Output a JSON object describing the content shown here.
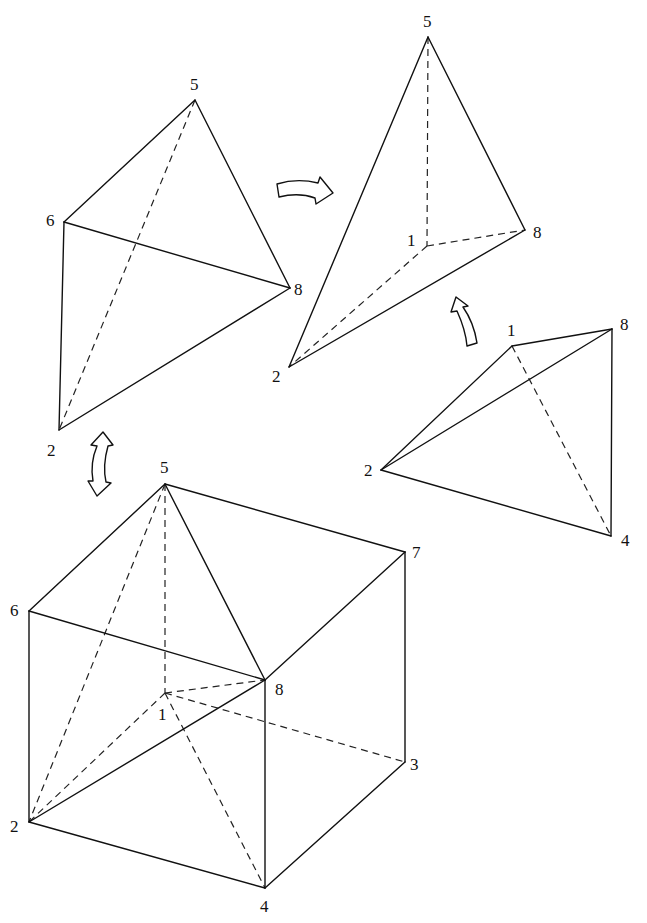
{
  "diagram": {
    "title": "",
    "figures": [
      {
        "id": "tetra-upper-left",
        "vertices": {
          "5": [
            195,
            100
          ],
          "6": [
            64,
            222
          ],
          "8": [
            290,
            288
          ],
          "2": [
            59,
            430
          ]
        },
        "labels": [
          {
            "text": "5",
            "x": 190,
            "y": 90
          },
          {
            "text": "6",
            "x": 46,
            "y": 226
          },
          {
            "text": "8",
            "x": 294,
            "y": 295
          },
          {
            "text": "2",
            "x": 47,
            "y": 456
          }
        ],
        "solid_edges": [
          [
            "5",
            "6"
          ],
          [
            "5",
            "8"
          ],
          [
            "6",
            "8"
          ],
          [
            "6",
            "2"
          ],
          [
            "2",
            "8"
          ]
        ],
        "dashed_edges": [
          [
            "5",
            "2"
          ]
        ]
      },
      {
        "id": "tetra-upper-right",
        "vertices": {
          "5": [
            428,
            37
          ],
          "1": [
            427,
            246
          ],
          "8": [
            525,
            230
          ],
          "2": [
            289,
            367
          ]
        },
        "labels": [
          {
            "text": "5",
            "x": 423,
            "y": 27
          },
          {
            "text": "1",
            "x": 407,
            "y": 246
          },
          {
            "text": "8",
            "x": 533,
            "y": 238
          },
          {
            "text": "2",
            "x": 272,
            "y": 382
          }
        ],
        "solid_edges": [
          [
            "5",
            "2"
          ],
          [
            "5",
            "8"
          ],
          [
            "2",
            "8"
          ]
        ],
        "dashed_edges": [
          [
            "5",
            "1"
          ],
          [
            "1",
            "8"
          ],
          [
            "1",
            "2"
          ]
        ]
      },
      {
        "id": "tetra-right",
        "vertices": {
          "1": [
            512,
            346
          ],
          "8": [
            612,
            329
          ],
          "2": [
            381,
            470
          ],
          "4": [
            611,
            536
          ]
        },
        "labels": [
          {
            "text": "1",
            "x": 507,
            "y": 336
          },
          {
            "text": "8",
            "x": 620,
            "y": 330
          },
          {
            "text": "2",
            "x": 364,
            "y": 476
          },
          {
            "text": "4",
            "x": 621,
            "y": 546
          }
        ],
        "solid_edges": [
          [
            "1",
            "8"
          ],
          [
            "1",
            "2"
          ],
          [
            "2",
            "8"
          ],
          [
            "2",
            "4"
          ],
          [
            "8",
            "4"
          ]
        ],
        "dashed_edges": [
          [
            "1",
            "4"
          ]
        ]
      },
      {
        "id": "cube",
        "vertices": {
          "5": [
            165,
            484
          ],
          "6": [
            29,
            611
          ],
          "7": [
            405,
            552
          ],
          "8": [
            265,
            680
          ],
          "1": [
            165,
            693
          ],
          "3": [
            405,
            762
          ],
          "2": [
            29,
            822
          ],
          "4": [
            265,
            888
          ]
        },
        "labels": [
          {
            "text": "5",
            "x": 160,
            "y": 473
          },
          {
            "text": "6",
            "x": 10,
            "y": 616
          },
          {
            "text": "7",
            "x": 412,
            "y": 558
          },
          {
            "text": "8",
            "x": 275,
            "y": 695
          },
          {
            "text": "1",
            "x": 158,
            "y": 720
          },
          {
            "text": "3",
            "x": 410,
            "y": 770
          },
          {
            "text": "2",
            "x": 10,
            "y": 832
          },
          {
            "text": "4",
            "x": 260,
            "y": 912
          }
        ],
        "solid_edges": [
          [
            "5",
            "6"
          ],
          [
            "5",
            "7"
          ],
          [
            "5",
            "8"
          ],
          [
            "6",
            "8"
          ],
          [
            "7",
            "8"
          ],
          [
            "6",
            "2"
          ],
          [
            "8",
            "4"
          ],
          [
            "7",
            "3"
          ],
          [
            "2",
            "4"
          ],
          [
            "4",
            "3"
          ],
          [
            "2",
            "8"
          ]
        ],
        "dashed_edges": [
          [
            "5",
            "1"
          ],
          [
            "1",
            "8"
          ],
          [
            "1",
            "3"
          ],
          [
            "1",
            "2"
          ],
          [
            "1",
            "4"
          ],
          [
            "5",
            "2"
          ]
        ]
      }
    ],
    "arrows": [
      {
        "id": "arrow-double-vertical",
        "type": "curved-double",
        "between": [
          "cube",
          "tetra-upper-left"
        ]
      },
      {
        "id": "arrow-right",
        "type": "curved-right",
        "between": [
          "tetra-upper-left",
          "tetra-upper-right"
        ]
      },
      {
        "id": "arrow-up",
        "type": "curved-up",
        "between": [
          "tetra-right",
          "tetra-upper-right"
        ]
      }
    ]
  }
}
